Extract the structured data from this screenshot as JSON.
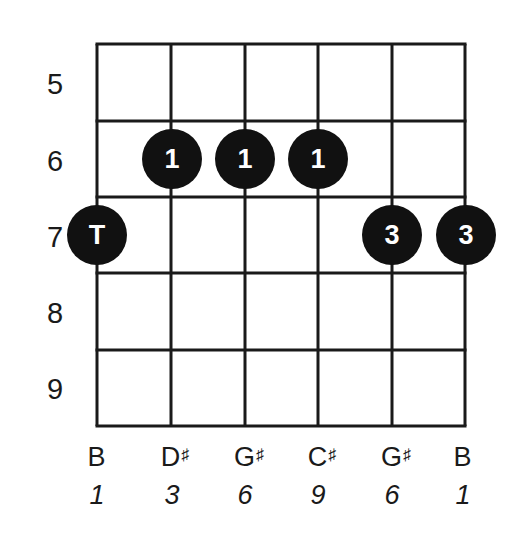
{
  "diagram": {
    "type": "guitar-chord-fretboard",
    "strings_count": 6,
    "start_fret": 5,
    "end_fret": 9,
    "fret_numbers": [
      "5",
      "6",
      "7",
      "8",
      "9"
    ],
    "strings": [
      {
        "note": "B",
        "accidental": "",
        "interval": "1"
      },
      {
        "note": "D",
        "accidental": "♯",
        "interval": "3"
      },
      {
        "note": "G",
        "accidental": "♯",
        "interval": "6"
      },
      {
        "note": "C",
        "accidental": "♯",
        "interval": "9"
      },
      {
        "note": "G",
        "accidental": "♯",
        "interval": "6"
      },
      {
        "note": "B",
        "accidental": "",
        "interval": "1"
      }
    ],
    "dots": [
      {
        "string": 1,
        "fret": 7,
        "label": "T"
      },
      {
        "string": 2,
        "fret": 6,
        "label": "1"
      },
      {
        "string": 3,
        "fret": 6,
        "label": "1"
      },
      {
        "string": 4,
        "fret": 6,
        "label": "1"
      },
      {
        "string": 5,
        "fret": 7,
        "label": "3"
      },
      {
        "string": 6,
        "fret": 7,
        "label": "3"
      }
    ],
    "colors": {
      "line": "#1a1a1a",
      "dot_fill": "#111111",
      "dot_text": "#ffffff",
      "background": "#ffffff"
    }
  }
}
